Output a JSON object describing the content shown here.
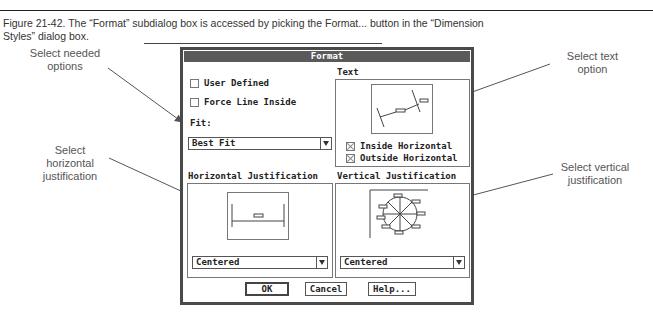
{
  "figure": {
    "caption_line1": "Figure 21-42.   The “Format” subdialog box is accessed by picking the Format... button in the “Dimension",
    "caption_line2": "Styles” dialog box."
  },
  "callouts": {
    "needed_options": [
      "Select needed",
      "options"
    ],
    "text_option": [
      "Select text",
      "option"
    ],
    "horizontal": [
      "Select",
      "horizontal",
      "justification"
    ],
    "vertical": [
      "Select vertical",
      "justification"
    ]
  },
  "dialog": {
    "title": "Format",
    "options": {
      "user_defined": {
        "label": "User Defined",
        "checked": false
      },
      "force_line_inside": {
        "label": "Force Line Inside",
        "checked": false
      }
    },
    "fit": {
      "label": "Fit:",
      "value": "Best Fit"
    },
    "text": {
      "label": "Text",
      "inside_horizontal": {
        "label": "Inside Horizontal",
        "checked": true
      },
      "outside_horizontal": {
        "label": "Outside Horizontal",
        "checked": true
      }
    },
    "horizontal_justification": {
      "label": "Horizontal Justification",
      "value": "Centered"
    },
    "vertical_justification": {
      "label": "Vertical Justification",
      "value": "Centered"
    },
    "buttons": {
      "ok": "OK",
      "cancel": "Cancel",
      "help": "Help..."
    }
  }
}
